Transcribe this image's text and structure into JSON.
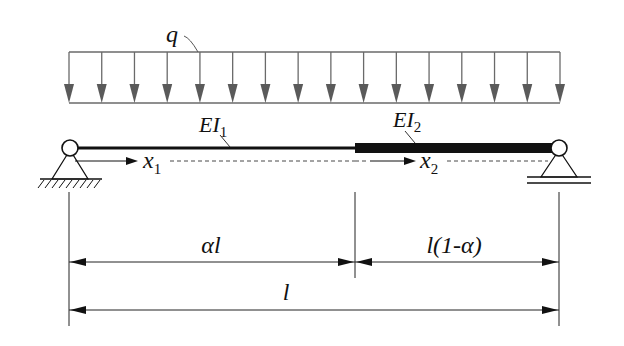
{
  "diagram": {
    "type": "simply-supported stepped beam under uniform distributed load",
    "load": {
      "label": "q",
      "kind": "uniformly distributed load",
      "arrow_count": 16,
      "color": "#5a5a5a"
    },
    "segments": [
      {
        "id": "segment-1",
        "stiffness_label": "EI",
        "stiffness_sub": "1",
        "coord_label": "x",
        "coord_sub": "1",
        "length_label": "αl"
      },
      {
        "id": "segment-2",
        "stiffness_label": "EI",
        "stiffness_sub": "2",
        "coord_label": "x",
        "coord_sub": "2",
        "length_label": "l(1-α)"
      }
    ],
    "supports": {
      "left": "fixed pin support",
      "right": "roller support"
    },
    "total_length_label": "l",
    "colors": {
      "line": "#111111",
      "load": "#5a5a5a",
      "background": "#ffffff"
    }
  }
}
